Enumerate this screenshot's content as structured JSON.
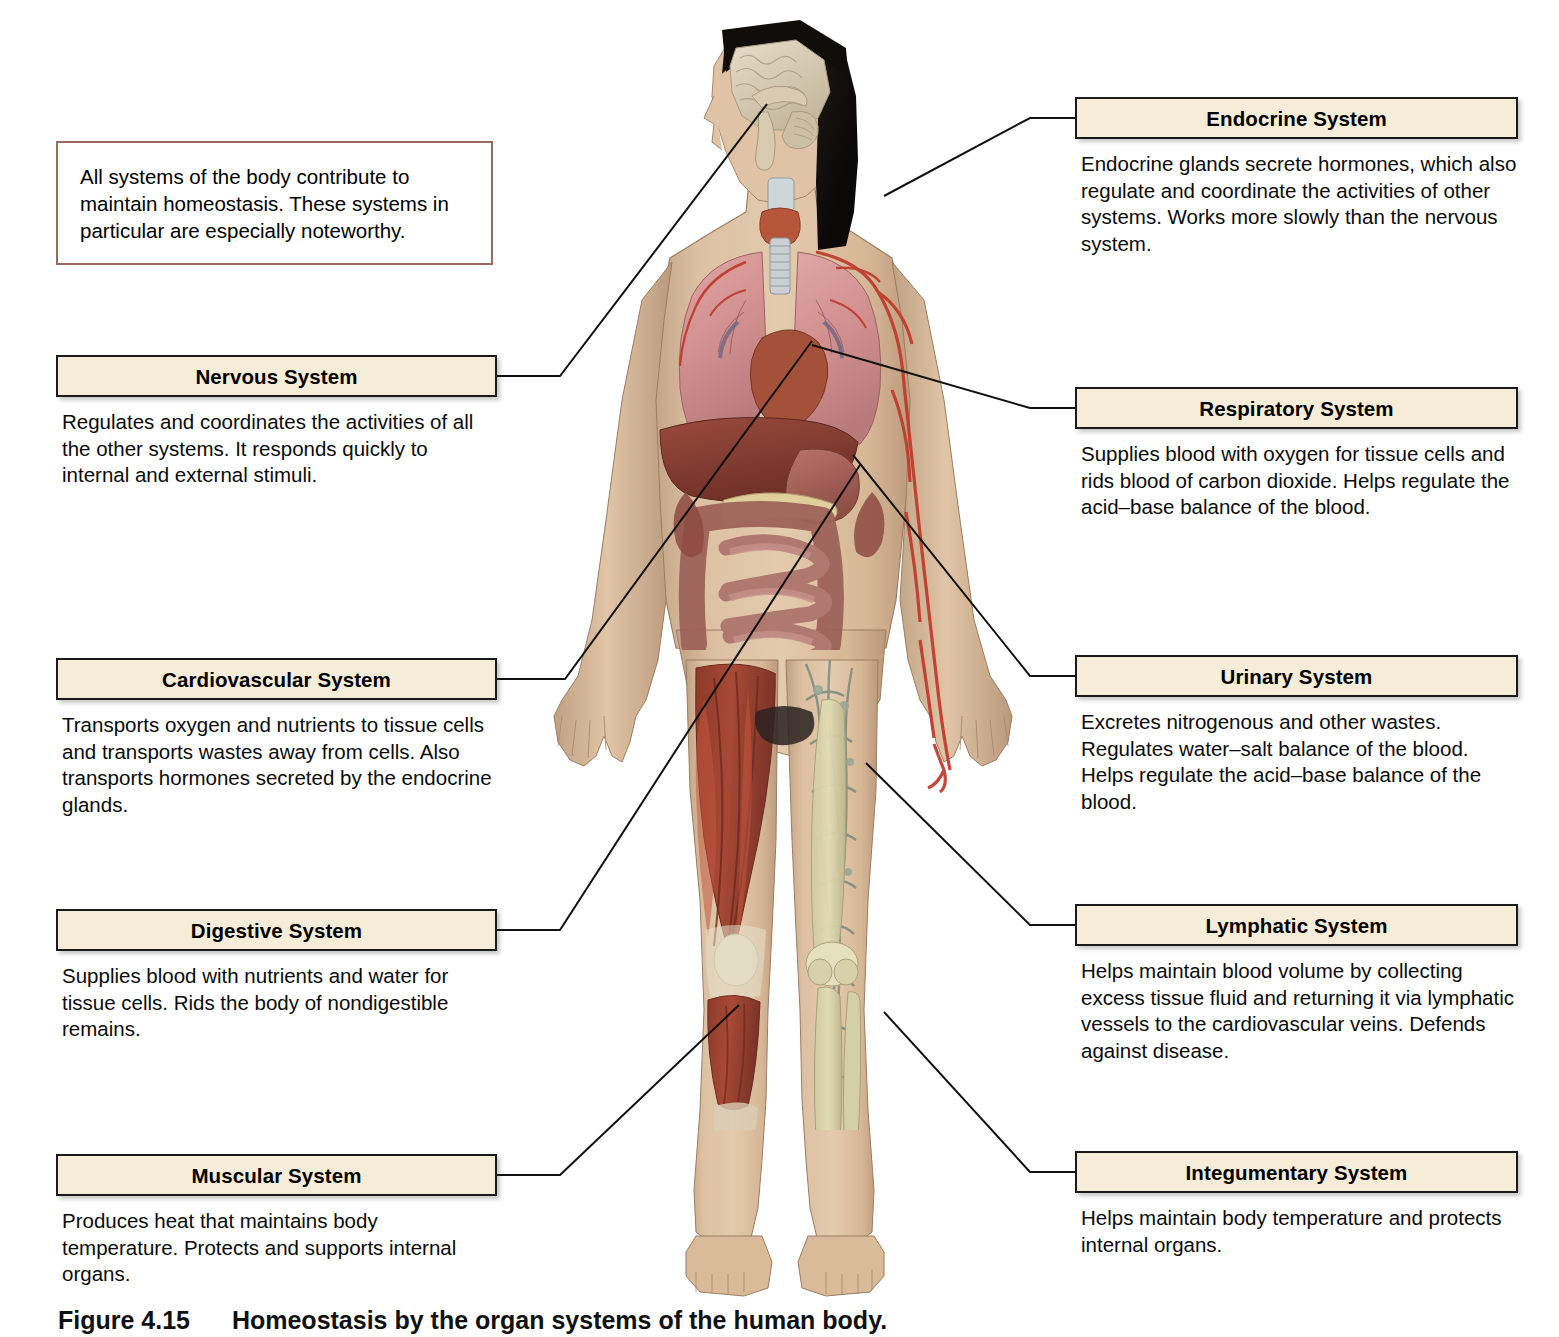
{
  "note": {
    "text": "All systems of the body contribute to maintain homeostasis. These systems in particular are especially noteworthy.",
    "border_color": "#9a6a5e"
  },
  "style": {
    "box_fill": "#f6edd8",
    "box_border": "#1a1a1a",
    "leader_color": "#111111"
  },
  "left_blocks": [
    {
      "title": "Nervous System",
      "desc": "Regulates and coordinates the activities of all the other systems. It responds quickly to internal and external stimuli."
    },
    {
      "title": "Cardiovascular System",
      "desc": "Transports oxygen and nutrients to tissue cells and transports wastes away from cells. Also transports hormones secreted by the endocrine glands."
    },
    {
      "title": "Digestive System",
      "desc": "Supplies blood with nutrients and water for tissue cells. Rids the body of nondigestible remains."
    },
    {
      "title": "Muscular System",
      "desc": "Produces heat that maintains body temperature. Protects and supports internal organs."
    }
  ],
  "right_blocks": [
    {
      "title": "Endocrine System",
      "desc": "Endocrine glands secrete hormones, which also regulate and coordinate the activities of other systems. Works more slowly than the nervous system."
    },
    {
      "title": "Respiratory System",
      "desc": "Supplies blood with oxygen for tissue cells and rids blood of carbon dioxide. Helps regulate the acid–base balance of the blood."
    },
    {
      "title": "Urinary System",
      "desc": "Excretes nitrogenous and other wastes. Regulates water–salt balance of the blood. Helps regulate the acid–base balance of the blood."
    },
    {
      "title": "Lymphatic System",
      "desc": "Helps maintain blood volume by collecting excess tissue fluid and returning it via lymphatic vessels to the cardiovascular veins. Defends against disease."
    },
    {
      "title": "Integumentary System",
      "desc": "Helps maintain body temperature and protects internal organs."
    }
  ],
  "caption": {
    "number": "Figure 4.15",
    "text": "Homeostasis by the organ systems of the human body."
  },
  "figure": {
    "alt": "Anterior view of a female human body showing internal organ systems: brain in sagittal section, thyroid, lungs, heart, liver, stomach, pancreas, intestines, arteries, muscles of the left leg, lymphatic vessels and bones of the right leg."
  }
}
